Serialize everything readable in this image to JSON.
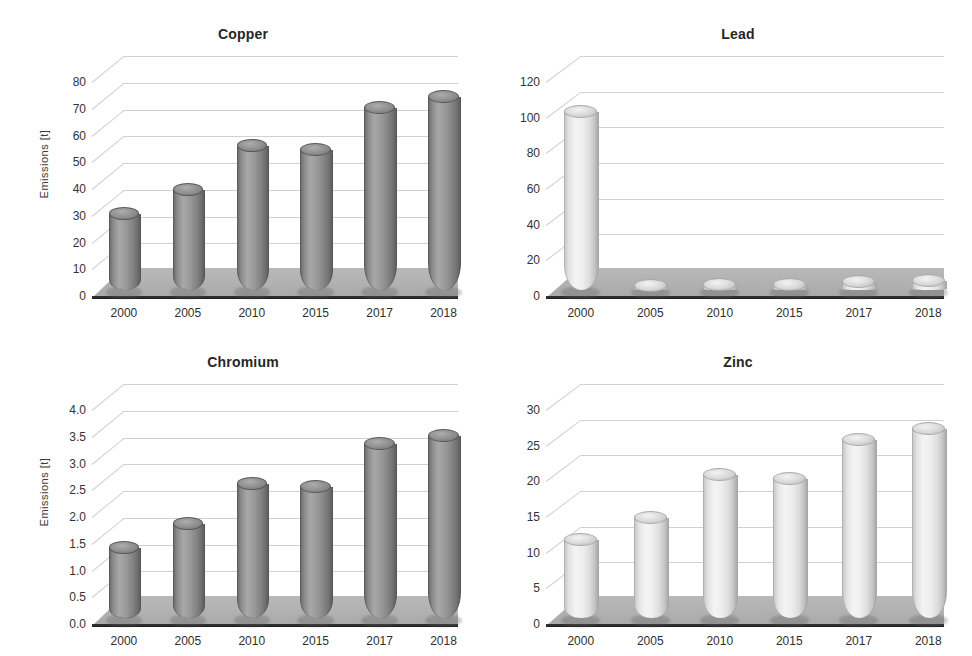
{
  "figure": {
    "ylabel": "Emissions [t]",
    "categories": [
      "2000",
      "2005",
      "2010",
      "2015",
      "2017",
      "2018"
    ]
  },
  "chart_data": [
    {
      "type": "bar",
      "title": "Copper",
      "categories": [
        "2000",
        "2005",
        "2010",
        "2015",
        "2017",
        "2018"
      ],
      "values": [
        28.5,
        37.5,
        54,
        52.5,
        68,
        72
      ],
      "xlabel": "",
      "ylabel": "Emissions [t]",
      "ylim": [
        0,
        80
      ],
      "yticks": [
        0,
        10,
        20,
        30,
        40,
        50,
        60,
        70,
        80
      ],
      "ytick_labels": [
        "0",
        "10",
        "20",
        "30",
        "40",
        "50",
        "60",
        "70",
        "80"
      ],
      "grid": true,
      "legend": "none",
      "bar_style": "3d-cylinder-dark",
      "color": "#8f8f8f"
    },
    {
      "type": "bar",
      "title": "Lead",
      "categories": [
        "2000",
        "2005",
        "2010",
        "2015",
        "2017",
        "2018"
      ],
      "values": [
        100,
        2,
        3,
        3,
        4.5,
        5
      ],
      "xlabel": "",
      "ylabel": "",
      "ylim": [
        0,
        120
      ],
      "yticks": [
        0,
        20,
        40,
        60,
        80,
        100,
        120
      ],
      "ytick_labels": [
        "0",
        "20",
        "40",
        "60",
        "80",
        "100",
        "120"
      ],
      "grid": true,
      "legend": "none",
      "bar_style": "3d-cylinder-light",
      "color": "#e8e8e8"
    },
    {
      "type": "bar",
      "title": "Chromium",
      "categories": [
        "2000",
        "2005",
        "2010",
        "2015",
        "2017",
        "2018"
      ],
      "values": [
        1.3,
        1.75,
        2.5,
        2.45,
        3.25,
        3.4
      ],
      "xlabel": "",
      "ylabel": "Emissions [t]",
      "ylim": [
        0,
        4.0
      ],
      "yticks": [
        0,
        0.5,
        1.0,
        1.5,
        2.0,
        2.5,
        3.0,
        3.5,
        4.0
      ],
      "ytick_labels": [
        "0.0",
        "0.5",
        "1.0",
        "1.5",
        "2.0",
        "2.5",
        "3.0",
        "3.5",
        "4.0"
      ],
      "grid": true,
      "legend": "none",
      "bar_style": "3d-cylinder-dark",
      "color": "#8f8f8f"
    },
    {
      "type": "bar",
      "title": "Zinc",
      "categories": [
        "2000",
        "2005",
        "2010",
        "2015",
        "2017",
        "2018"
      ],
      "values": [
        11,
        14,
        20,
        19.5,
        25,
        26.5
      ],
      "xlabel": "",
      "ylabel": "",
      "ylim": [
        0,
        30
      ],
      "yticks": [
        0,
        5,
        10,
        15,
        20,
        25,
        30
      ],
      "ytick_labels": [
        "0",
        "5",
        "10",
        "15",
        "20",
        "25",
        "30"
      ],
      "grid": true,
      "legend": "none",
      "bar_style": "3d-cylinder-light",
      "color": "#e8e8e8"
    }
  ]
}
